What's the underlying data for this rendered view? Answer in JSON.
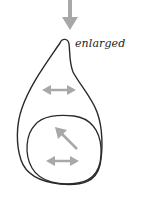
{
  "diagram": {
    "label": "enlarged",
    "colors": {
      "outline": "#2a2a2a",
      "arrow": "#a8a8a8",
      "background": "#ffffff"
    },
    "elements": [
      {
        "type": "arrow",
        "direction": "down",
        "description": "input arrow pointing to the cell tip"
      },
      {
        "type": "outline",
        "shape": "teardrop",
        "description": "enlarged cell outline"
      },
      {
        "type": "outline",
        "shape": "ellipse",
        "description": "inner rounded body"
      },
      {
        "type": "double-arrow",
        "direction": "horizontal",
        "location": "upper teardrop"
      },
      {
        "type": "arrow",
        "direction": "up-left",
        "location": "inside inner body"
      },
      {
        "type": "double-arrow",
        "direction": "horizontal",
        "location": "inside inner body"
      }
    ]
  }
}
